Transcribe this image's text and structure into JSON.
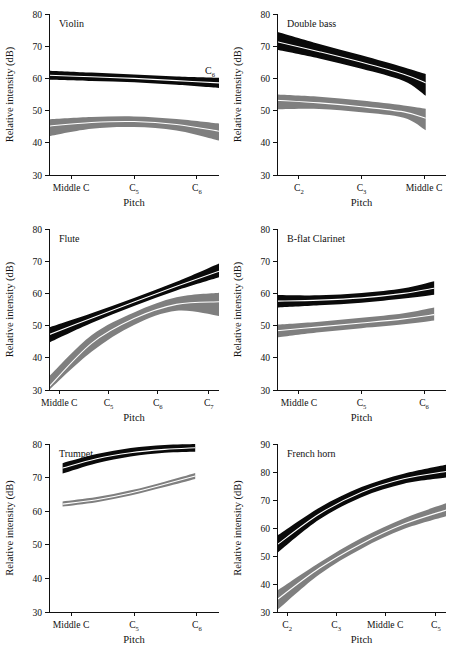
{
  "figure": {
    "axis_label_y": "Relative intensity (dB)",
    "axis_label_x": "Pitch",
    "series_names": [
      "fortissimo",
      "pianissimo"
    ],
    "colors": {
      "fortissimo": "#0a0a0a",
      "pianissimo": "#7f7f7f",
      "centerline": "#ffffff",
      "axis": "#111111"
    }
  },
  "chart_data": [
    {
      "type": "area",
      "title": "Violin",
      "xlabel": "Pitch",
      "ylabel": "Relative intensity (dB)",
      "ylim": [
        30,
        80
      ],
      "yticks": [
        30,
        40,
        50,
        60,
        70,
        80
      ],
      "xticks": [
        "Middle C",
        "C5",
        "C6"
      ],
      "xtick_labels": [
        "Middle C",
        "C",
        "C"
      ],
      "xtick_subs": [
        "",
        "5",
        "6"
      ],
      "annotation": "C6",
      "annotation_sub": "6",
      "grid": false,
      "series": [
        {
          "name": "fortissimo",
          "color": "#0a0a0a",
          "x": [
            0.0,
            0.25,
            0.5,
            0.75,
            1.0
          ],
          "mean": [
            61.0,
            60.5,
            60.0,
            59.3,
            58.6
          ],
          "lower": [
            59.6,
            59.2,
            58.8,
            58.0,
            57.0
          ],
          "upper": [
            62.4,
            61.8,
            61.2,
            60.6,
            60.2
          ]
        },
        {
          "name": "pianissimo",
          "color": "#7f7f7f",
          "x": [
            0.0,
            0.25,
            0.5,
            0.75,
            1.0
          ],
          "mean": [
            45.2,
            46.3,
            46.6,
            45.7,
            43.6
          ],
          "lower": [
            42.1,
            44.4,
            44.9,
            43.8,
            40.7
          ],
          "upper": [
            47.3,
            48.0,
            48.2,
            47.4,
            46.0
          ]
        }
      ]
    },
    {
      "type": "area",
      "title": "Double bass",
      "xlabel": "Pitch",
      "ylabel": "Relative intensity (dB)",
      "ylim": [
        30,
        80
      ],
      "yticks": [
        30,
        40,
        50,
        60,
        70,
        80
      ],
      "xticks": [
        "C2",
        "C3",
        "Middle C"
      ],
      "xtick_labels": [
        "C",
        "C",
        "Middle C"
      ],
      "xtick_subs": [
        "2",
        "3",
        ""
      ],
      "grid": false,
      "series": [
        {
          "name": "fortissimo",
          "color": "#0a0a0a",
          "x": [
            0.0,
            0.25,
            0.5,
            0.75,
            0.88
          ],
          "mean": [
            71.4,
            68.3,
            65.0,
            61.3,
            58.6
          ],
          "lower": [
            68.9,
            66.2,
            63.0,
            59.2,
            54.6
          ],
          "upper": [
            74.5,
            70.7,
            67.2,
            63.5,
            61.4
          ]
        },
        {
          "name": "pianissimo",
          "color": "#7f7f7f",
          "x": [
            0.0,
            0.25,
            0.5,
            0.75,
            0.88
          ],
          "mean": [
            53.2,
            52.4,
            51.2,
            49.6,
            47.6
          ],
          "lower": [
            50.4,
            50.5,
            49.5,
            47.8,
            43.9
          ],
          "upper": [
            55.0,
            54.3,
            53.1,
            51.6,
            50.6
          ]
        }
      ]
    },
    {
      "type": "area",
      "title": "Flute",
      "xlabel": "Pitch",
      "ylabel": "Relative intensity (dB)",
      "ylim": [
        30,
        80
      ],
      "yticks": [
        30,
        40,
        50,
        60,
        70,
        80
      ],
      "xticks": [
        "Middle C",
        "C5",
        "C6",
        "C7"
      ],
      "xtick_labels": [
        "Middle C",
        "C",
        "C",
        "C"
      ],
      "xtick_subs": [
        "",
        "5",
        "6",
        "7"
      ],
      "grid": false,
      "series": [
        {
          "name": "fortissimo",
          "color": "#0a0a0a",
          "x": [
            0.0,
            0.25,
            0.5,
            0.75,
            1.0
          ],
          "mean": [
            47.2,
            52.3,
            57.3,
            62.2,
            66.9
          ],
          "lower": [
            44.7,
            50.8,
            56.1,
            60.9,
            65.0
          ],
          "upper": [
            49.4,
            53.8,
            58.6,
            63.6,
            69.3
          ]
        },
        {
          "name": "pianissimo",
          "color": "#7f7f7f",
          "x": [
            0.0,
            0.25,
            0.5,
            0.75,
            1.0
          ],
          "mean": [
            31.0,
            44.5,
            52.2,
            56.6,
            57.4
          ],
          "lower": [
            28.0,
            41.9,
            50.2,
            54.6,
            53.0
          ],
          "upper": [
            34.2,
            47.0,
            54.1,
            58.8,
            60.2
          ]
        }
      ]
    },
    {
      "type": "area",
      "title": "B-flat Clarinet",
      "xlabel": "Pitch",
      "ylabel": "Relative intensity (dB)",
      "ylim": [
        30,
        80
      ],
      "yticks": [
        30,
        40,
        50,
        60,
        70,
        80
      ],
      "xticks": [
        "Middle C",
        "C5",
        "C6"
      ],
      "xtick_labels": [
        "Middle C",
        "C",
        "C"
      ],
      "xtick_subs": [
        "",
        "5",
        "6"
      ],
      "grid": false,
      "series": [
        {
          "name": "fortissimo",
          "color": "#0a0a0a",
          "x": [
            0.0,
            0.25,
            0.5,
            0.75,
            0.93
          ],
          "mean": [
            57.6,
            57.9,
            58.6,
            60.0,
            61.6
          ],
          "lower": [
            55.6,
            56.3,
            57.1,
            58.4,
            59.6
          ],
          "upper": [
            59.5,
            59.4,
            60.1,
            61.6,
            63.8
          ]
        },
        {
          "name": "pianissimo",
          "color": "#7f7f7f",
          "x": [
            0.0,
            0.25,
            0.5,
            0.75,
            0.93
          ],
          "mean": [
            48.4,
            49.6,
            50.8,
            52.1,
            53.4
          ],
          "lower": [
            46.3,
            47.9,
            49.2,
            50.4,
            51.6
          ],
          "upper": [
            50.3,
            51.2,
            52.4,
            53.8,
            55.6
          ]
        }
      ]
    },
    {
      "type": "area",
      "title": "Trumpet",
      "xlabel": "Pitch",
      "ylabel": "Relative intensity (dB)",
      "ylim": [
        30,
        80
      ],
      "yticks": [
        30,
        40,
        50,
        60,
        70,
        80
      ],
      "xticks": [
        "Middle C",
        "C5",
        "C6"
      ],
      "xtick_labels": [
        "Middle C",
        "C",
        "C"
      ],
      "xtick_subs": [
        "",
        "5",
        "6"
      ],
      "grid": false,
      "series": [
        {
          "name": "fortissimo",
          "color": "#0a0a0a",
          "x": [
            0.08,
            0.28,
            0.48,
            0.68,
            0.86
          ],
          "mean": [
            72.8,
            75.6,
            77.4,
            78.4,
            78.9
          ],
          "lower": [
            71.2,
            74.3,
            76.3,
            77.4,
            77.7
          ],
          "upper": [
            74.3,
            77.0,
            78.8,
            79.7,
            80.0
          ]
        },
        {
          "name": "pianissimo",
          "color": "#7f7f7f",
          "x": [
            0.08,
            0.28,
            0.48,
            0.68,
            0.86
          ],
          "mean": [
            62.1,
            63.4,
            65.4,
            68.0,
            70.5
          ],
          "lower": [
            61.4,
            62.7,
            64.7,
            67.2,
            69.6
          ],
          "upper": [
            62.9,
            64.2,
            66.2,
            68.8,
            71.4
          ]
        }
      ]
    },
    {
      "type": "area",
      "title": "French horn",
      "xlabel": "Pitch",
      "ylabel": "Relative intensity (dB)",
      "ylim": [
        30,
        90
      ],
      "yticks": [
        30,
        40,
        50,
        60,
        70,
        80,
        90
      ],
      "xticks": [
        "C2",
        "C3",
        "Middle C",
        "C5"
      ],
      "xtick_labels": [
        "C",
        "C",
        "Middle C",
        "C"
      ],
      "xtick_subs": [
        "2",
        "3",
        "",
        "5"
      ],
      "grid": false,
      "series": [
        {
          "name": "fortissimo",
          "color": "#0a0a0a",
          "x": [
            0.0,
            0.25,
            0.5,
            0.75,
            1.0
          ],
          "mean": [
            54.0,
            65.0,
            72.8,
            77.6,
            80.2
          ],
          "lower": [
            51.0,
            63.0,
            71.0,
            75.8,
            78.0
          ],
          "upper": [
            57.2,
            67.2,
            74.6,
            79.4,
            82.6
          ]
        },
        {
          "name": "pianissimo",
          "color": "#7f7f7f",
          "x": [
            0.0,
            0.25,
            0.5,
            0.75,
            1.0
          ],
          "mean": [
            34.4,
            45.6,
            54.4,
            61.4,
            66.4
          ],
          "lower": [
            30.6,
            43.4,
            52.6,
            59.6,
            64.2
          ],
          "upper": [
            37.6,
            47.6,
            56.4,
            63.4,
            68.8
          ]
        }
      ]
    }
  ]
}
